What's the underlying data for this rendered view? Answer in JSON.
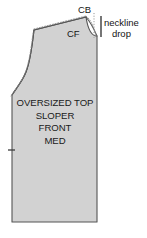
{
  "diagram": {
    "piece_label_lines": [
      "OVERSIZED TOP",
      "SLOPER",
      "FRONT",
      "MED"
    ],
    "markers": {
      "center_back": "CB",
      "center_front": "CF"
    },
    "measurement": {
      "name_line_1": "neckline",
      "name_line_2": "drop"
    },
    "colors": {
      "piece_fill": "#d2d2d2",
      "piece_outline": "#555555",
      "dotted_seam": "#7a7a7a",
      "text": "#141414",
      "background": "#ffffff"
    }
  }
}
